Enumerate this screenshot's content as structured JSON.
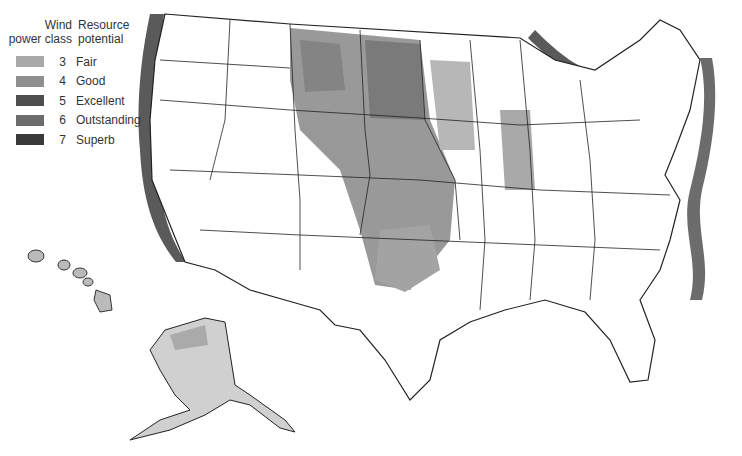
{
  "legend": {
    "header_class": "Wind\npower class",
    "header_class_line1": "Wind",
    "header_class_line2": "power class",
    "header_potential_line1": "Resource",
    "header_potential_line2": "potential",
    "items": [
      {
        "class": "3",
        "label": "Fair",
        "color": "#a9a9a9"
      },
      {
        "class": "4",
        "label": "Good",
        "color": "#8f8f8f"
      },
      {
        "class": "5",
        "label": "Excellent",
        "color": "#4e4e4e"
      },
      {
        "class": "6",
        "label": "Outstanding",
        "color": "#6c6c6c"
      },
      {
        "class": "7",
        "label": "Superb",
        "color": "#3a3a3a"
      }
    ]
  },
  "map": {
    "subject": "United States wind power resource potential",
    "regions": [
      "contiguous-us",
      "alaska",
      "hawaii"
    ],
    "colors": {
      "land": "#ffffff",
      "border": "#222222",
      "fair": "#a9a9a9",
      "good": "#8f8f8f",
      "excellent": "#4e4e4e",
      "outstanding": "#6c6c6c",
      "superb": "#3a3a3a"
    }
  }
}
